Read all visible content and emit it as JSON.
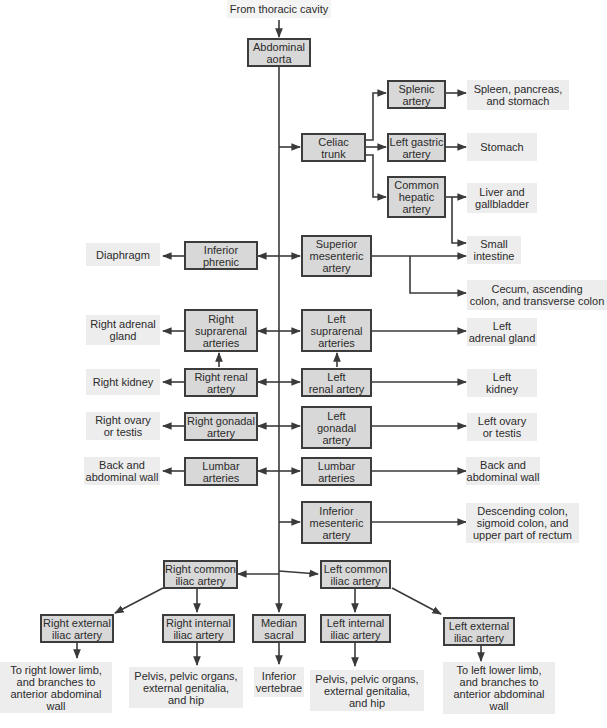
{
  "diagram": {
    "title_source": "From thoracic cavity",
    "colors": {
      "artery_fill": "#d8d8d8",
      "artery_border": "#3c3c3c",
      "target_fill": "#ededed",
      "line": "#3a3a3a"
    },
    "arteries": {
      "abdominal_aorta": "Abdominal\naorta",
      "celiac_trunk": "Celiac\ntrunk",
      "splenic_artery": "Splenic\nartery",
      "left_gastric_artery": "Left gastric\nartery",
      "common_hepatic_artery": "Common\nhepatic\nartery",
      "superior_mesenteric_artery": "Superior\nmesenteric\nartery",
      "inferior_phrenic": "Inferior\nphrenic",
      "right_suprarenal_arteries": "Right\nsuprarenal\narteries",
      "left_suprarenal_arteries": "Left\nsuprarenal\narteries",
      "right_renal_artery": "Right renal\nartery",
      "left_renal_artery": "Left\nrenal artery",
      "right_gonadal_artery": "Right gonadal\nartery",
      "left_gonadal_artery": "Left\ngonadal\nartery",
      "lumbar_arteries_right": "Lumbar\narteries",
      "lumbar_arteries_left": "Lumbar\narteries",
      "inferior_mesenteric_artery": "Inferior\nmesenteric\nartery",
      "right_common_iliac_artery": "Right common\niliac artery",
      "left_common_iliac_artery": "Left common\niliac artery",
      "right_external_iliac_artery": "Right external\niliac artery",
      "right_internal_iliac_artery": "Right internal\niliac artery",
      "median_sacral": "Median\nsacral",
      "left_internal_iliac_artery": "Left internal\niliac artery",
      "left_external_iliac_artery": "Left external\niliac artery"
    },
    "targets": {
      "spleen_pancreas_stomach": "Spleen, pancreas,\nand stomach",
      "stomach": "Stomach",
      "liver_gallbladder": "Liver and\ngallbladder",
      "small_intestine": "Small\nintestine",
      "cecum_colon": "Cecum, ascending\ncolon, and transverse colon",
      "diaphragm": "Diaphragm",
      "right_adrenal_gland": "Right adrenal\ngland",
      "left_adrenal_gland": "Left\nadrenal gland",
      "right_kidney": "Right kidney",
      "left_kidney": "Left\nkidney",
      "right_ovary_testis": "Right ovary\nor testis",
      "left_ovary_testis": "Left ovary\nor testis",
      "back_wall_right": "Back and\nabdominal wall",
      "back_wall_left": "Back and\nabdominal wall",
      "descending_colon": "Descending colon,\nsigmoid colon, and\nupper part of rectum",
      "right_lower_limb": "To right lower limb,\nand branches to\nanterior abdominal\nwall",
      "right_pelvis": "Pelvis, pelvic organs,\nexternal genitalia,\nand hip",
      "inferior_vertebrae": "Inferior\nvertebrae",
      "left_pelvis": "Pelvis, pelvic organs,\nexternal genitalia,\nand hip",
      "left_lower_limb": "To left lower limb,\nand branches to\nanterior abdominal\nwall"
    }
  }
}
